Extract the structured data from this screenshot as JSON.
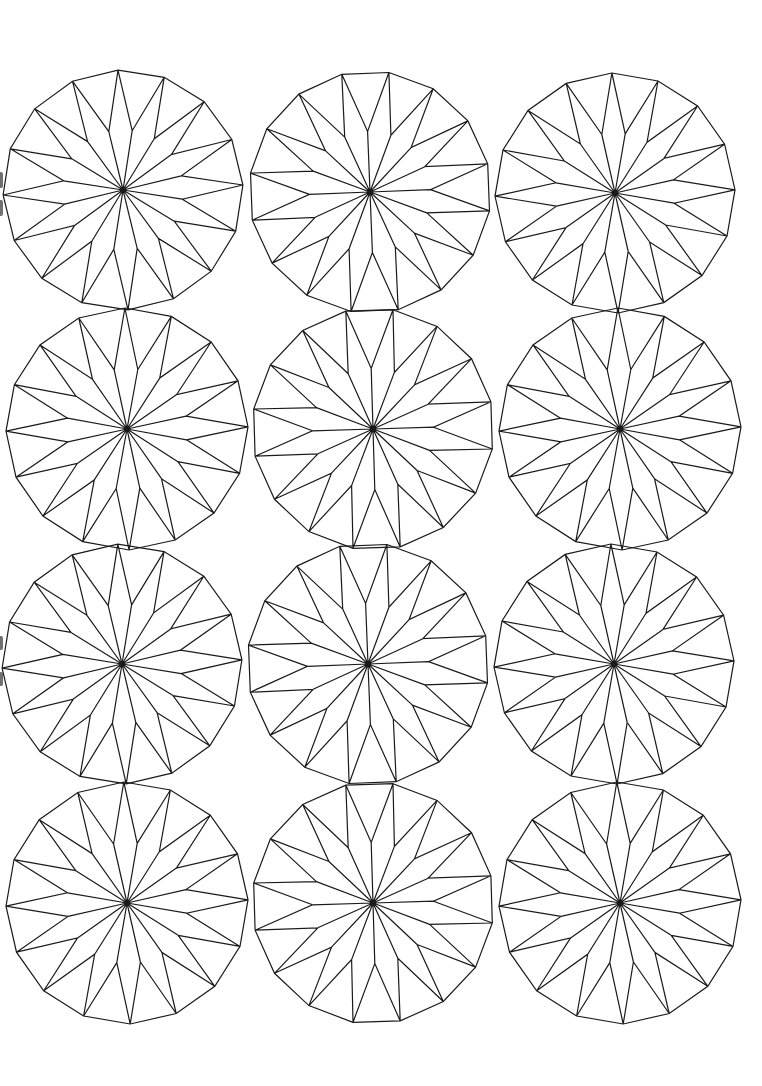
{
  "page": {
    "width": 762,
    "height": 1086,
    "background": "#ffffff",
    "stroke_color": "#1a1a1a",
    "stroke_width": 1.2,
    "hub_radius": 3
  },
  "pattern": {
    "name": "16-point star rosette",
    "outer_vertices": 16,
    "inner_radius_ratio": 0.5
  },
  "grid": {
    "rows": 4,
    "columns": 3,
    "rosettes": [
      {
        "row": 1,
        "col": 1,
        "cx": 123,
        "cy": 190,
        "r": 120,
        "rotation_deg": -2.4
      },
      {
        "row": 1,
        "col": 2,
        "cx": 370,
        "cy": 192,
        "r": 121,
        "rotation_deg": 9.0
      },
      {
        "row": 1,
        "col": 3,
        "cx": 615,
        "cy": 193,
        "r": 120,
        "rotation_deg": -1.5
      },
      {
        "row": 2,
        "col": 1,
        "cx": 127,
        "cy": 429,
        "r": 121,
        "rotation_deg": -1.0
      },
      {
        "row": 2,
        "col": 2,
        "cx": 373,
        "cy": 429,
        "r": 121,
        "rotation_deg": 9.5
      },
      {
        "row": 2,
        "col": 3,
        "cx": 620,
        "cy": 429,
        "r": 121,
        "rotation_deg": -1.0
      },
      {
        "row": 3,
        "col": 1,
        "cx": 122,
        "cy": 664,
        "r": 120,
        "rotation_deg": -2.0
      },
      {
        "row": 3,
        "col": 2,
        "cx": 368,
        "cy": 664,
        "r": 121,
        "rotation_deg": 9.0
      },
      {
        "row": 3,
        "col": 3,
        "cx": 614,
        "cy": 664,
        "r": 120,
        "rotation_deg": -1.5
      },
      {
        "row": 4,
        "col": 1,
        "cx": 127,
        "cy": 903,
        "r": 121,
        "rotation_deg": -1.5
      },
      {
        "row": 4,
        "col": 2,
        "cx": 373,
        "cy": 903,
        "r": 121,
        "rotation_deg": 9.5
      },
      {
        "row": 4,
        "col": 3,
        "cx": 620,
        "cy": 903,
        "r": 121,
        "rotation_deg": -1.5
      }
    ]
  },
  "edge_marks": [
    {
      "top": 172,
      "height": 16
    },
    {
      "top": 200,
      "height": 16
    },
    {
      "top": 636,
      "height": 14
    },
    {
      "top": 672,
      "height": 14
    }
  ]
}
